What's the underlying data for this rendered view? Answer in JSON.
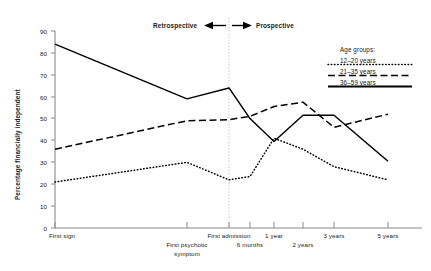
{
  "chart_data": {
    "type": "line",
    "title": "",
    "xlabel": "",
    "ylabel": "Percentage financially independent",
    "ylim": [
      0,
      90
    ],
    "ytick_step": 10,
    "yticks": [
      0,
      10,
      20,
      30,
      40,
      50,
      60,
      70,
      80,
      90
    ],
    "grid": false,
    "legend_position": "top-right",
    "categories": [
      "First sign",
      "First psychotic symptom",
      "First admission",
      "6 months",
      "1 year",
      "2 years",
      "3 years",
      "5 years"
    ],
    "series": [
      {
        "name": "12–20 years",
        "style": "dotted",
        "values": [
          21,
          30,
          22,
          23.5,
          41,
          36,
          28,
          22
        ]
      },
      {
        "name": "21–35 years",
        "style": "dashed",
        "values": [
          36,
          49,
          49.5,
          51,
          55.5,
          57.5,
          46,
          52
        ]
      },
      {
        "name": "36–59 years",
        "style": "solid",
        "values": [
          84,
          59,
          64,
          50,
          39.5,
          51.5,
          51.5,
          30.5
        ]
      }
    ],
    "annotations": [
      {
        "name": "retrospective",
        "text": "Retrospective",
        "arrow": "left"
      },
      {
        "name": "prospective",
        "text": "Prospective",
        "arrow": "right"
      },
      {
        "name": "divider",
        "text": "",
        "at_category": "First admission"
      }
    ]
  },
  "axis": {
    "y_title": "Percentage financially independent",
    "y_ticks": [
      "0",
      "10",
      "20",
      "30",
      "40",
      "50",
      "60",
      "70",
      "80",
      "90"
    ],
    "x_ticks": [
      {
        "line1": "First sign",
        "line2": ""
      },
      {
        "line1": "",
        "line2": "First psychotic"
      },
      {
        "line1": "",
        "line2": "symptom"
      },
      {
        "line1": "First admission",
        "line2": ""
      },
      {
        "line1": "",
        "line2": "6 months"
      },
      {
        "line1": "1 year",
        "line2": ""
      },
      {
        "line1": "",
        "line2": "2 years"
      },
      {
        "line1": "3 years",
        "line2": ""
      },
      {
        "line1": "5 years",
        "line2": ""
      }
    ],
    "labels": {
      "first_sign": "First sign",
      "first_psychotic": "First psychotic",
      "symptom": "symptom",
      "first_admission": "First admission",
      "six_months": "6 months",
      "one_year": "1 year",
      "two_years": "2 years",
      "three_years": "3 years",
      "five_years": "5 years"
    }
  },
  "phases": {
    "retrospective": "Retrospective",
    "prospective": "Prospective"
  },
  "legend": {
    "title": "Age groups:",
    "entries": [
      {
        "label": "12–20 years",
        "style": "dotted"
      },
      {
        "label": "21–35 years",
        "style": "dashed"
      },
      {
        "label": "36–59 years",
        "style": "solid"
      }
    ]
  },
  "colors": {
    "line": "#000000",
    "axis": "#808080",
    "divider": "#b4b4b4",
    "text": "#1a1a1a"
  }
}
